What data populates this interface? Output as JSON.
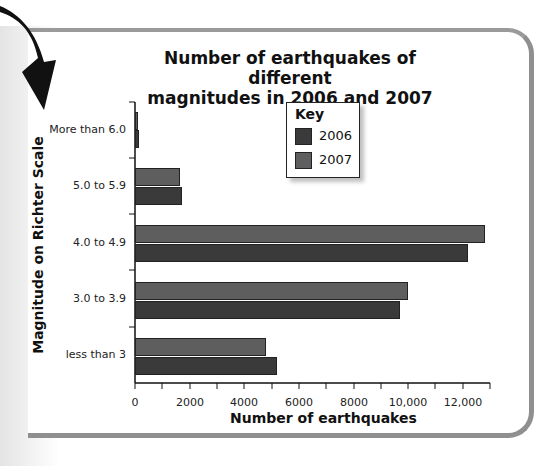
{
  "chart_data": {
    "type": "bar",
    "orientation": "horizontal",
    "title": "Number of earthquakes of different magnitudes in 2006 and 2007",
    "title_lines": [
      "Number of earthquakes of different",
      "magnitudes in 2006 and 2007"
    ],
    "xlabel": "Number of earthquakes",
    "ylabel": "Magnitude on Richter Scale",
    "categories": [
      "More than 6.0",
      "5.0 to 5.9",
      "4.0 to 4.9",
      "3.0 to 3.9",
      "less than 3"
    ],
    "series": [
      {
        "name": "2006",
        "color": "#3a3a3a",
        "values": [
          140,
          1720,
          12200,
          9700,
          5200
        ]
      },
      {
        "name": "2007",
        "color": "#5e5e5e",
        "values": [
          90,
          1650,
          12800,
          10000,
          4800
        ]
      }
    ],
    "xlim": [
      0,
      13000
    ],
    "x_ticks": [
      0,
      2000,
      4000,
      6000,
      8000,
      10000,
      12000
    ],
    "x_tick_labels": [
      "0",
      "2000",
      "4000",
      "6000",
      "8000",
      "10,000",
      "12,000"
    ],
    "grid": false,
    "legend": {
      "title": "Key",
      "position": "top-center",
      "entries": [
        "2006",
        "2007"
      ]
    }
  }
}
